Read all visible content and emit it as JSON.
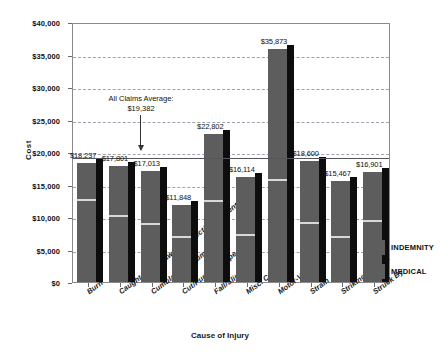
{
  "chart_data": {
    "type": "bar",
    "title": "",
    "xlabel": "Cause of Injury",
    "ylabel": "Cost",
    "ylim": [
      0,
      40000
    ],
    "yticks": [
      0,
      5000,
      10000,
      15000,
      20000,
      25000,
      30000,
      35000,
      40000
    ],
    "ytick_labels": [
      "$0",
      "$5,000",
      "$10,000",
      "$15,000",
      "$20,000",
      "$25,000",
      "$30,000",
      "$35,000",
      "$40,000"
    ],
    "grid": true,
    "legend_position": "right",
    "stacked": true,
    "categories": [
      "Burn",
      "Caught in or Between Object/Equipment",
      "Cumulative Trauma",
      "Cut/Punch/Scrape",
      "Fall/Slip",
      "Misc. Cause",
      "Motor-Vehicle",
      "Strain",
      "Striking Against",
      "Struck By"
    ],
    "values": [
      18237,
      17801,
      17013,
      11848,
      22802,
      16114,
      35873,
      18600,
      15467,
      16901
    ],
    "value_labels": [
      "$18,237",
      "$17,801",
      "$17,013",
      "$11,848",
      "$22,802",
      "$16,114",
      "$35,873",
      "$18,600",
      "$15,467",
      "$16,901"
    ],
    "series": [
      {
        "name": "MEDICAL",
        "values": [
          12400,
          10000,
          8700,
          6700,
          12300,
          7100,
          15500,
          9000,
          6800,
          9200
        ]
      },
      {
        "name": "INDEMNITY",
        "values": [
          5837,
          7801,
          8313,
          5148,
          10502,
          9014,
          20373,
          9600,
          8667,
          7701
        ]
      }
    ],
    "annotations": [
      {
        "text_line1": "All Claims Average:",
        "text_line2": "$19,382",
        "value": 19382,
        "type": "reference-line-with-arrow"
      }
    ],
    "colors": {
      "bar": "#5d5d5d",
      "shadow": "#0d0d0d",
      "split": "#d8d8d8",
      "gridline": "#9aa3b0",
      "refline": "#55555a",
      "axis": "#8a8a8a",
      "text": "#111111"
    }
  },
  "legend": {
    "items": [
      {
        "label": "INDEMNITY"
      },
      {
        "label": "MEDICAL"
      }
    ]
  }
}
